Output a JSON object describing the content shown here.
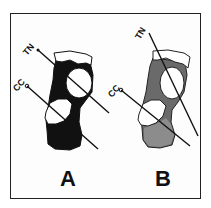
{
  "figure": {
    "panels": [
      {
        "id": "A",
        "label": "A",
        "bone_fill": "#111111",
        "lines": [
          {
            "label": "TN"
          },
          {
            "label": "CC"
          }
        ]
      },
      {
        "id": "B",
        "label": "B",
        "bone_fill": "#6a6a6a",
        "lines": [
          {
            "label": "TN"
          },
          {
            "label": "CC"
          }
        ]
      }
    ],
    "colors": {
      "border": "#222222",
      "background": "#ffffff",
      "joint_surface": "#ffffff"
    }
  }
}
